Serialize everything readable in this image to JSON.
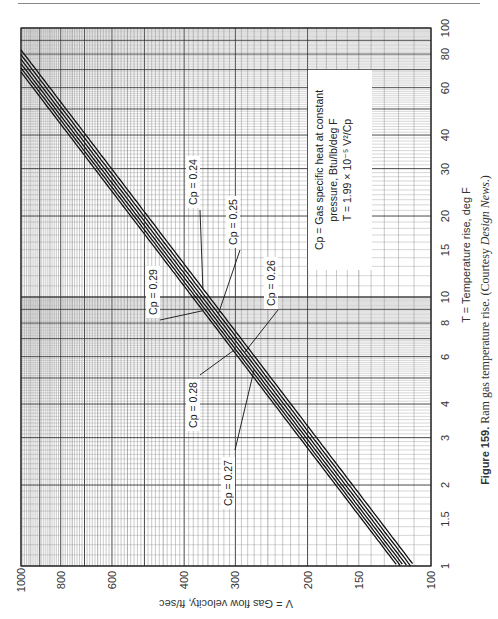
{
  "chart_data": {
    "type": "line",
    "title": "Ram gas temperature rise",
    "caption": {
      "figure_label": "Figure 159.",
      "text": "Ram gas temperature rise. (Courtesy ",
      "source": "Design News",
      "suffix": ".)"
    },
    "orientation": "rotated 90° counter-clockwise",
    "xlabel": "V = Gas flow velocity, ft/sec",
    "ylabel": "T = Temperature rise, deg F",
    "x_scale": "log",
    "y_scale": "log",
    "xlim": [
      100,
      1000
    ],
    "ylim": [
      1,
      100
    ],
    "x_ticks": [
      1000,
      800,
      600,
      400,
      300,
      200,
      150,
      100
    ],
    "y_ticks": [
      1,
      1.5,
      2,
      3,
      4,
      6,
      8,
      10,
      15,
      20,
      30,
      40,
      60,
      80,
      100
    ],
    "grid": true,
    "formula": "T = 1.99 × 10^-5 V²/Cp",
    "annotation": {
      "line1": "Cp = Gas specific heat at constant",
      "line2": "pressure, Btu/lb/deg F",
      "line3": "T = 1.99 × 10⁻⁵ V²/Cp"
    },
    "series": [
      {
        "name": "Cp = 0.24",
        "cp": 0.24,
        "x": [
          1000,
          800,
          600,
          400,
          300,
          200,
          150,
          110
        ],
        "y": [
          82.9,
          53.1,
          29.9,
          13.3,
          7.46,
          3.32,
          1.87,
          1.0
        ]
      },
      {
        "name": "Cp = 0.25",
        "cp": 0.25,
        "x": [
          1000,
          800,
          600,
          400,
          300,
          200,
          150,
          112
        ],
        "y": [
          79.6,
          50.9,
          28.7,
          12.7,
          7.16,
          3.18,
          1.79,
          1.0
        ]
      },
      {
        "name": "Cp = 0.26",
        "cp": 0.26,
        "x": [
          1000,
          800,
          600,
          400,
          300,
          200,
          150,
          114
        ],
        "y": [
          76.5,
          49.0,
          27.6,
          12.2,
          6.89,
          3.06,
          1.72,
          1.0
        ]
      },
      {
        "name": "Cp = 0.27",
        "cp": 0.27,
        "x": [
          1000,
          800,
          600,
          400,
          300,
          200,
          150,
          116
        ],
        "y": [
          73.7,
          47.2,
          26.5,
          11.8,
          6.63,
          2.95,
          1.66,
          1.0
        ]
      },
      {
        "name": "Cp = 0.28",
        "cp": 0.28,
        "x": [
          1000,
          800,
          600,
          400,
          300,
          200,
          150,
          119
        ],
        "y": [
          71.1,
          45.5,
          25.6,
          11.4,
          6.4,
          2.84,
          1.6,
          1.0
        ]
      },
      {
        "name": "Cp = 0.29",
        "cp": 0.29,
        "x": [
          1000,
          800,
          600,
          400,
          300,
          200,
          150,
          121
        ],
        "y": [
          68.6,
          43.9,
          24.7,
          11.0,
          6.18,
          2.74,
          1.54,
          1.0
        ]
      }
    ],
    "legend": "inline callout labels"
  },
  "labels": {
    "x_axis_title": "V = Gas flow velocity, ft/sec",
    "y_axis_title": "T = Temperature rise, deg F",
    "x_ticks": [
      "1000",
      "800",
      "600",
      "400",
      "300",
      "200",
      "150",
      "100"
    ],
    "y_ticks": [
      "100",
      "80",
      "60",
      "40",
      "30",
      "20",
      "15",
      "10",
      "8",
      "6",
      "4",
      "3",
      "2",
      "1.5",
      "1"
    ],
    "cp_labels": [
      "Cp = 0.24",
      "Cp = 0.25",
      "Cp = 0.26",
      "Cp = 0.27",
      "Cp = 0.28",
      "Cp = 0.29"
    ],
    "note_line1": "Cp = Gas specific heat at constant",
    "note_line2": "pressure, Btu/lb/deg F",
    "note_line3": "T = 1.99 × 10⁻⁵ V²/Cp",
    "caption_figure": "Figure 159.",
    "caption_text": " Ram gas temperature rise. (Courtesy ",
    "caption_source": "Design News",
    "caption_suffix": ".)"
  }
}
